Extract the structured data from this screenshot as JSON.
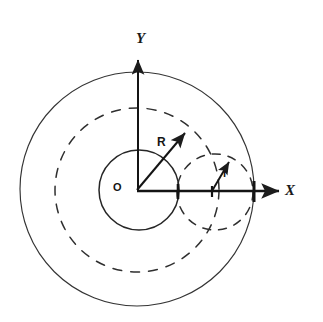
{
  "figure": {
    "background_color": "#ffffff",
    "stroke_color": "#222222",
    "labels": {
      "y_axis": "Y",
      "x_axis": "X",
      "origin": "O",
      "vector_large": "R",
      "vector_small": "r"
    },
    "geometry": {
      "origin": {
        "x": 137,
        "y": 190
      },
      "outer_solid_circle": {
        "cx": 137,
        "cy": 189,
        "r": 117,
        "style": "solid"
      },
      "outer_dashed_circle": {
        "cx": 137,
        "cy": 190,
        "r": 82,
        "style": "dashed"
      },
      "inner_solid_circle": {
        "cx": 139,
        "cy": 190,
        "r": 40,
        "style": "solid"
      },
      "small_dashed_circle": {
        "cx": 215,
        "cy": 192,
        "r": 38,
        "style": "dashed"
      },
      "y_axis_arrow": {
        "x1": 138,
        "y1": 190,
        "x2": 138,
        "y2": 57
      },
      "x_axis_arrow": {
        "x1": 137,
        "y1": 191,
        "x2": 281,
        "y2": 191
      },
      "vector_R_arrow": {
        "x1": 137,
        "y1": 190,
        "x2": 187,
        "y2": 131
      },
      "vector_r_arrow": {
        "x1": 212,
        "y1": 191,
        "x2": 230,
        "y2": 160
      },
      "x_axis_ticks": [
        178,
        213,
        254
      ]
    }
  }
}
